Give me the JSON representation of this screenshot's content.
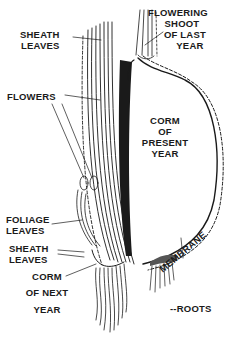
{
  "diagram": {
    "labels": {
      "sheath_leaves_top": [
        "SHEATH",
        "LEAVES"
      ],
      "flowering_shoot": [
        "FLOWERING",
        "SHOOT",
        "OF LAST",
        "YEAR"
      ],
      "flowers": "FLOWERS",
      "corm_present": [
        "CORM",
        "OF",
        "PRESENT",
        "YEAR"
      ],
      "foliage_leaves": [
        "FOLIAGE",
        "LEAVES"
      ],
      "sheath_leaves_bottom": [
        "SHEATH",
        "LEAVES"
      ],
      "corm_next": [
        "CORM",
        "OF NEXT",
        "YEAR"
      ],
      "membrane": "MEMBRANE",
      "roots": "--ROOTS"
    },
    "colors": {
      "ink": "#1a1a1a",
      "background": "#ffffff"
    }
  }
}
